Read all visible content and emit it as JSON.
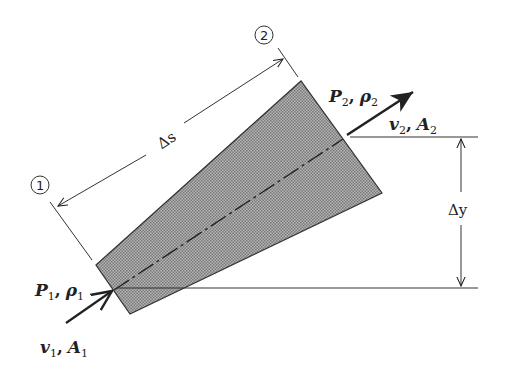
{
  "diagram": {
    "title": "",
    "colors": {
      "tube_fill": "#9a9a9a",
      "line": "#222222",
      "background": "#ffffff"
    },
    "section_markers": [
      {
        "id": "1",
        "label": "1"
      },
      {
        "id": "2",
        "label": "2"
      }
    ],
    "dimensions": {
      "length_label": "Δs",
      "height_label": "Δy"
    },
    "inlet": {
      "pressure": "P",
      "pressure_sub": "1",
      "density": "ρ",
      "density_sub": "1",
      "velocity": "v",
      "velocity_sub": "1",
      "area": "A",
      "area_sub": "1",
      "separator": ","
    },
    "outlet": {
      "pressure": "P",
      "pressure_sub": "2",
      "density": "ρ",
      "density_sub": "2",
      "velocity": "v",
      "velocity_sub": "2",
      "area": "A",
      "area_sub": "2",
      "separator": ","
    }
  }
}
